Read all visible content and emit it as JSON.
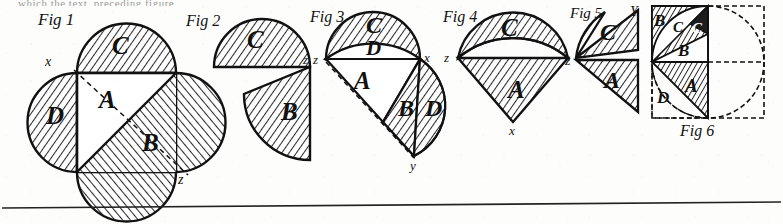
{
  "plate": {
    "width": 783,
    "height": 224,
    "background_color": "#fdfdfb",
    "ink_color": "#161616",
    "hatch_color": "#2a2a2a",
    "cutoff_header_text": "which the text, preceding figure"
  },
  "figures": [
    {
      "id": "fig1",
      "caption": "Fig 1",
      "region_labels": [
        "C",
        "A",
        "D",
        "B"
      ],
      "point_labels": [
        "x",
        "z"
      ],
      "description": "square A with semicircles C top, D left, B lower-right, dashed diagonal x to z"
    },
    {
      "id": "fig2",
      "caption": "Fig 2",
      "region_labels": [
        "C",
        "B"
      ],
      "point_labels": [
        "z"
      ],
      "description": "semicircle C above chord, rotated quarter sector B below right, vertex z"
    },
    {
      "id": "fig3",
      "caption": "Fig 3",
      "region_labels": [
        "C",
        "D",
        "A",
        "B",
        "D"
      ],
      "point_labels": [
        "z",
        "x",
        "y"
      ],
      "description": "lune C over lens D, triangle A, hatched sector B, crescent D right, dashed line z to y"
    },
    {
      "id": "fig4",
      "caption": "Fig 4",
      "region_labels": [
        "C",
        "A"
      ],
      "point_labels": [
        "z",
        "x"
      ],
      "description": "hatched lune C above, hatched triangle A below, z left vertex, x bottom vertex"
    },
    {
      "id": "fig5",
      "caption": "Fig 5",
      "region_labels": [
        "C",
        "A"
      ],
      "point_labels": [
        "Y",
        "z"
      ],
      "description": "curved wedge C upper with Y top right, triangle A lower, z left vertex"
    },
    {
      "id": "fig6",
      "caption": "Fig 6",
      "region_labels": [
        "B",
        "C",
        "C",
        "B",
        "A",
        "D"
      ],
      "point_labels": [],
      "description": "dashed square with inscribed dashed circle, quadrant subdivisions B C C B A D at left"
    }
  ],
  "rule": {
    "name": "bottom-horizontal-rule",
    "y": 205,
    "color": "#222222"
  }
}
